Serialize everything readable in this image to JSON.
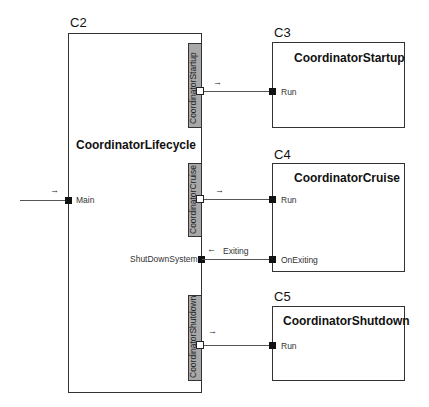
{
  "diagram": {
    "main": {
      "id": "C2",
      "title": "CoordinatorLifecycle",
      "ports": {
        "input": "Main",
        "shutdown": "ShutDownSystem"
      },
      "sub_bars": [
        {
          "label": "CoordinatorStartup"
        },
        {
          "label": "CoordinatorCruise"
        },
        {
          "label": "CoordinatorShutdown"
        }
      ]
    },
    "components": [
      {
        "id": "C3",
        "title": "CoordinatorStartup",
        "ports": [
          "Run"
        ]
      },
      {
        "id": "C4",
        "title": "CoordinatorCruise",
        "ports": [
          "Run",
          "OnExiting"
        ]
      },
      {
        "id": "C5",
        "title": "CoordinatorShutdown",
        "ports": [
          "Run"
        ]
      }
    ],
    "connections": [
      {
        "from": "Main (external)",
        "to": "C2.Main",
        "direction": "→"
      },
      {
        "from": "C2.CoordinatorStartup",
        "to": "C3.Run",
        "direction": "→"
      },
      {
        "from": "C2.CoordinatorCruise",
        "to": "C4.Run",
        "direction": "→"
      },
      {
        "from": "C4.OnExiting",
        "to": "C2.ShutDownSystem",
        "direction": "←",
        "label": "Exiting"
      },
      {
        "from": "C2.CoordinatorShutdown",
        "to": "C5.Run",
        "direction": "→"
      }
    ],
    "arrows": {
      "right": "→",
      "left": "←",
      "exiting_label": "Exiting"
    }
  }
}
